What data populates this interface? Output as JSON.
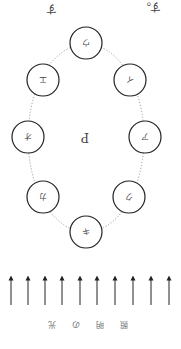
{
  "orientation": "rotated-180",
  "top_text": {
    "left_fragment": "す",
    "right_fragment": "す。"
  },
  "center_label": "P",
  "circles": [
    {
      "label": "ウ",
      "cx": 86,
      "cy": 43
    },
    {
      "label": "イ",
      "cx": 130,
      "cy": 80
    },
    {
      "label": "ア",
      "cx": 145,
      "cy": 137
    },
    {
      "label": "ク",
      "cx": 129,
      "cy": 197
    },
    {
      "label": "キ",
      "cx": 86,
      "cy": 232
    },
    {
      "label": "カ",
      "cx": 43,
      "cy": 197
    },
    {
      "label": "オ",
      "cx": 28,
      "cy": 137
    },
    {
      "label": "エ",
      "cx": 43,
      "cy": 80
    }
  ],
  "arrows": {
    "count": 10,
    "direction": "up"
  },
  "light_label": [
    "照",
    "明",
    "の",
    "光"
  ],
  "colors": {
    "stroke": "#222222",
    "dotted": "#888888",
    "text": "#444444"
  }
}
